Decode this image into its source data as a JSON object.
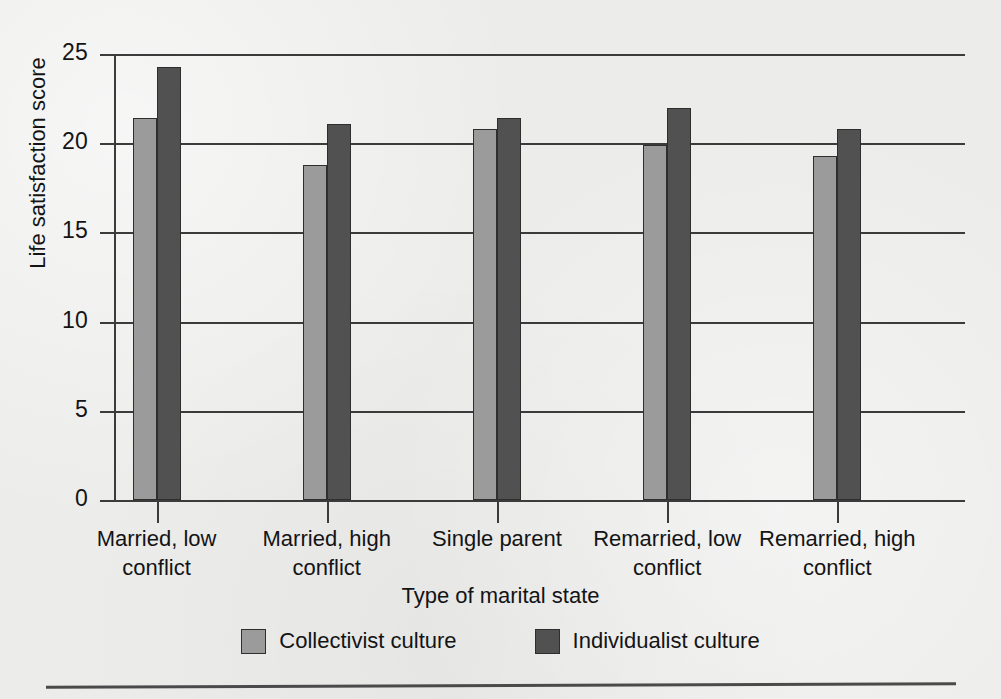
{
  "chart_data": {
    "type": "bar",
    "title": "",
    "xlabel": "Type of marital state",
    "ylabel": "Life satisfaction score",
    "categories": [
      "Married, low\nconflict",
      "Married, high\nconflict",
      "Single parent",
      "Remarried, low\nconflict",
      "Remarried, high\nconflict"
    ],
    "category_lines": [
      [
        "Married, low",
        "conflict"
      ],
      [
        "Married, high",
        "conflict"
      ],
      [
        "Single parent",
        ""
      ],
      [
        "Remarried, low",
        "conflict"
      ],
      [
        "Remarried, high",
        "conflict"
      ]
    ],
    "series": [
      {
        "name": "Collectivist culture",
        "color": "#9b9b9b",
        "values": [
          21.4,
          18.8,
          20.8,
          19.9,
          19.3
        ]
      },
      {
        "name": "Individualist culture",
        "color": "#515151",
        "values": [
          24.3,
          21.1,
          21.4,
          22.0,
          20.8
        ]
      }
    ],
    "ylim": [
      0,
      25
    ],
    "yticks": [
      0,
      5,
      10,
      15,
      20,
      25
    ],
    "ytick_labels": [
      "0",
      "5",
      "10",
      "15",
      "20",
      "25"
    ],
    "grid": true,
    "legend_position": "bottom"
  },
  "legend": {
    "items": [
      {
        "label": "Collectivist culture",
        "color": "#9b9b9b"
      },
      {
        "label": "Individualist culture",
        "color": "#515151"
      }
    ]
  },
  "axes": {
    "x_title": "Type of marital state",
    "y_title": "Life satisfaction score"
  }
}
